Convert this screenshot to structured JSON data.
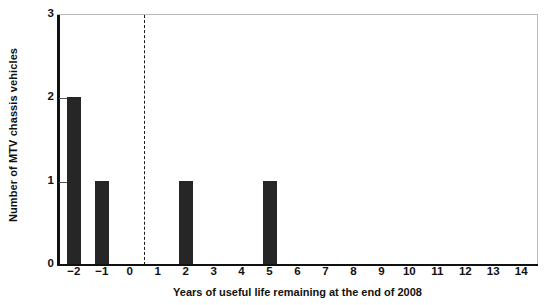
{
  "chart_data": {
    "type": "bar",
    "title": "",
    "xlabel": "Years of useful life remaining at the end of 2008",
    "ylabel": "Number of MTV chassis vehicles",
    "categories": [
      "−2",
      "−1",
      "0",
      "1",
      "2",
      "3",
      "4",
      "5",
      "6",
      "7",
      "8",
      "9",
      "10",
      "11",
      "12",
      "13",
      "14"
    ],
    "x": [
      -2,
      -1,
      0,
      1,
      2,
      3,
      4,
      5,
      6,
      7,
      8,
      9,
      10,
      11,
      12,
      13,
      14
    ],
    "values": [
      2,
      1,
      0,
      0,
      1,
      0,
      0,
      1,
      0,
      0,
      0,
      0,
      0,
      0,
      0,
      0,
      0
    ],
    "xlim": [
      -2.6,
      14.6
    ],
    "ylim": [
      0,
      3
    ],
    "yticks": [
      0,
      1,
      2,
      3
    ],
    "ytick_labels": [
      "0",
      "1",
      "2",
      "3"
    ],
    "grid": false,
    "legend": null,
    "bar_color": "#262626",
    "axis_color": "#111111",
    "frame_color": "#b9b9b9",
    "annotations": [
      {
        "name": "zero-divider",
        "type": "vertical-dashed-line",
        "x": 0.5,
        "color": "#1a1a1a"
      }
    ]
  }
}
